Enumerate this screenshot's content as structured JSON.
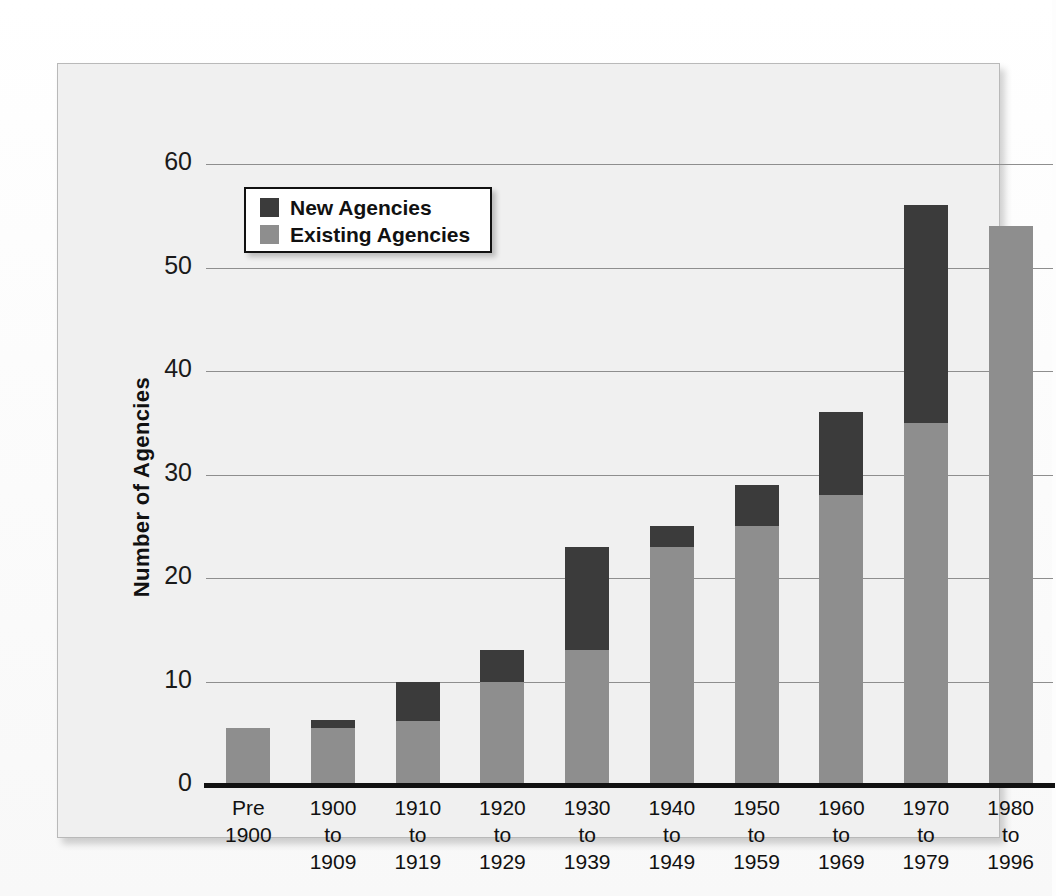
{
  "chart_data": {
    "type": "bar",
    "subtype": "stacked-bar",
    "title": "",
    "xlabel": "",
    "ylabel": "Number of Agencies",
    "ylim": [
      0,
      60
    ],
    "yticks": [
      0,
      10,
      20,
      30,
      40,
      50,
      60
    ],
    "ytick_labels": [
      "0",
      "10",
      "20",
      "30",
      "40",
      "50",
      "60"
    ],
    "grid": "horizontal",
    "legend_position": "upper-left-inside",
    "categories": [
      "Pre\n1900",
      "1900\nto\n1909",
      "1910\nto\n1919",
      "1920\nto\n1929",
      "1930\nto\n1939",
      "1940\nto\n1949",
      "1950\nto\n1959",
      "1960\nto\n1969",
      "1970\nto\n1979",
      "1980\nto\n1996"
    ],
    "category_lines": [
      [
        "Pre",
        "1900",
        ""
      ],
      [
        "1900",
        "to",
        "1909"
      ],
      [
        "1910",
        "to",
        "1919"
      ],
      [
        "1920",
        "to",
        "1929"
      ],
      [
        "1930",
        "to",
        "1939"
      ],
      [
        "1940",
        "to",
        "1949"
      ],
      [
        "1950",
        "to",
        "1959"
      ],
      [
        "1960",
        "to",
        "1969"
      ],
      [
        "1970",
        "to",
        "1979"
      ],
      [
        "1980",
        "to",
        "1996"
      ]
    ],
    "series": [
      {
        "name": "Existing Agencies",
        "color": "#8e8e8e",
        "values": [
          5.5,
          5.5,
          6.2,
          10,
          13,
          23,
          25,
          28,
          35,
          54
        ]
      },
      {
        "name": "New Agencies",
        "color": "#3b3b3b",
        "values": [
          0,
          0.8,
          3.8,
          3,
          10,
          2,
          4,
          8,
          21,
          0
        ]
      }
    ],
    "totals": [
      5.5,
      6.3,
      10,
      13,
      23,
      25,
      29,
      36,
      56,
      54
    ]
  },
  "legend": {
    "entries": [
      {
        "label": "New Agencies",
        "color": "#3b3b3b"
      },
      {
        "label": "Existing Agencies",
        "color": "#8e8e8e"
      }
    ]
  },
  "colors": {
    "panel_background": "#f0f0f0",
    "panel_border": "#b9b9b9",
    "page_background": "#fdfdfd",
    "gridline": "#8e8e8e",
    "axis": "#111111",
    "new_agencies": "#3b3b3b",
    "existing_agencies": "#8e8e8e",
    "text": "#111111"
  }
}
